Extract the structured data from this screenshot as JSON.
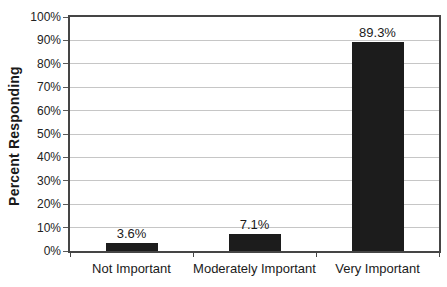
{
  "chart_data": {
    "type": "bar",
    "title": "",
    "categories": [
      "Not Important",
      "Moderately Important",
      "Very Important"
    ],
    "values": [
      3.6,
      7.1,
      89.3
    ],
    "value_labels": [
      "3.6%",
      "7.1%",
      "89.3%"
    ],
    "xlabel": "",
    "ylabel": "Percent Responding",
    "ylim": [
      0,
      100
    ],
    "y_tick_step": 10,
    "y_tick_labels": [
      "0%",
      "10%",
      "20%",
      "30%",
      "40%",
      "50%",
      "60%",
      "70%",
      "80%",
      "90%",
      "100%"
    ],
    "grid": "horizontal",
    "legend": "none",
    "colors": {
      "bar": "#1c1c1c",
      "gridline": "#c6c6c6",
      "plot_border": "#454545",
      "text": "#1a1a1a",
      "background": "#ffffff"
    }
  }
}
